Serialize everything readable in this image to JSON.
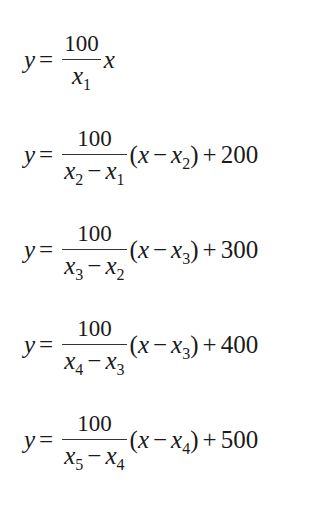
{
  "equations": [
    {
      "lhs": "y",
      "equals": "=",
      "numerator": "100",
      "denominator": {
        "a_var": "x",
        "a_sub": "1",
        "minus": "",
        "b_var": "",
        "b_sub": ""
      },
      "factor": {
        "open": "",
        "var": "x",
        "minus": "",
        "sub_var": "",
        "sub_index": "",
        "close": ""
      },
      "plus": "",
      "constant": ""
    },
    {
      "lhs": "y",
      "equals": "=",
      "numerator": "100",
      "denominator": {
        "a_var": "x",
        "a_sub": "2",
        "minus": "−",
        "b_var": "x",
        "b_sub": "1"
      },
      "factor": {
        "open": "(",
        "var": "x",
        "minus": "−",
        "sub_var": "x",
        "sub_index": "2",
        "close": ")"
      },
      "plus": "+",
      "constant": "200"
    },
    {
      "lhs": "y",
      "equals": "=",
      "numerator": "100",
      "denominator": {
        "a_var": "x",
        "a_sub": "3",
        "minus": "−",
        "b_var": "x",
        "b_sub": "2"
      },
      "factor": {
        "open": "(",
        "var": "x",
        "minus": "−",
        "sub_var": "x",
        "sub_index": "3",
        "close": ")"
      },
      "plus": "+",
      "constant": "300"
    },
    {
      "lhs": "y",
      "equals": "=",
      "numerator": "100",
      "denominator": {
        "a_var": "x",
        "a_sub": "4",
        "minus": "−",
        "b_var": "x",
        "b_sub": "3"
      },
      "factor": {
        "open": "(",
        "var": "x",
        "minus": "−",
        "sub_var": "x",
        "sub_index": "3",
        "close": ")"
      },
      "plus": "+",
      "constant": "400"
    },
    {
      "lhs": "y",
      "equals": "=",
      "numerator": "100",
      "denominator": {
        "a_var": "x",
        "a_sub": "5",
        "minus": "−",
        "b_var": "x",
        "b_sub": "4"
      },
      "factor": {
        "open": "(",
        "var": "x",
        "minus": "−",
        "sub_var": "x",
        "sub_index": "4",
        "close": ")"
      },
      "plus": "+",
      "constant": "500"
    }
  ]
}
